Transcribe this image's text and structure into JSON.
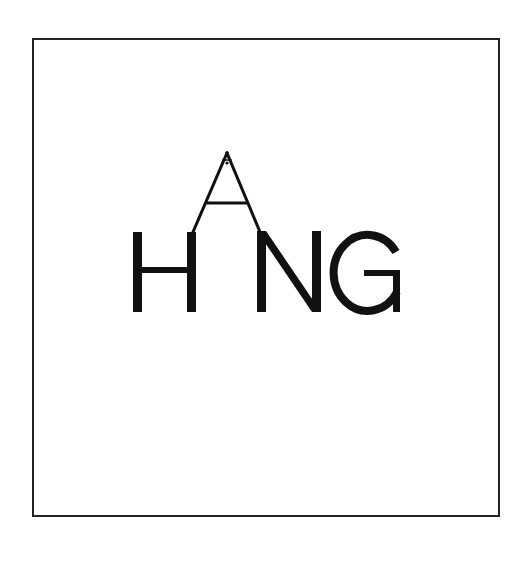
{
  "logo": {
    "wordmark": "HANG",
    "letters": [
      "H",
      "A",
      "N",
      "G"
    ],
    "description": "Wordmark where the letter A is drawn as an open triangular hanger rising above the baseline between H and N"
  },
  "colors": {
    "background": "#ffffff",
    "frame": "#222222",
    "ink": "#111111"
  }
}
